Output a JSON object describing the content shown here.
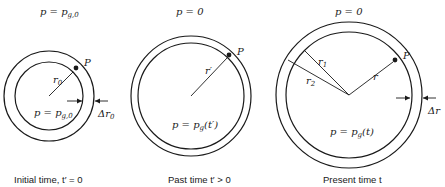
{
  "panels": [
    {
      "id": "initial",
      "top_label": "p = p",
      "top_label_sub": "g,0",
      "inner_label": "p = p",
      "inner_label_sub": "g,0",
      "radius_label": "r",
      "radius_label_sub": "0",
      "point_label": "P",
      "thickness_label": "Δr",
      "thickness_label_sub": "0",
      "caption": "Initial time, t′ = 0"
    },
    {
      "id": "past",
      "top_label": "p = 0",
      "inner_label": "p = p",
      "inner_label_sub": "g",
      "inner_label_tail": "(t′)",
      "radius_label": "r′",
      "point_label": "P",
      "caption": "Past time t′ > 0"
    },
    {
      "id": "present",
      "top_label": "p = 0",
      "inner_label": "p = p",
      "inner_label_sub": "g",
      "inner_label_tail": "(t)",
      "radius_label": "r",
      "r1_label": "r",
      "r1_sub": "1",
      "r2_label": "r",
      "r2_sub": "2",
      "point_label": "P",
      "thickness_label": "Δr",
      "caption": "Present time t"
    }
  ]
}
